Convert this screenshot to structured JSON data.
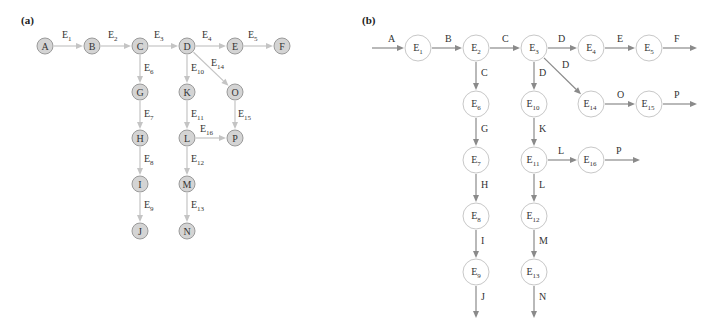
{
  "panels": [
    {
      "label": "(a)",
      "label_pos": {
        "x": 21,
        "y": 10
      },
      "style": {
        "node_fill": "#d4d4d4",
        "node_stroke": "#9a9a9a",
        "edge_color": "#c4c4c4",
        "node_r": 8,
        "font_size": 10
      },
      "nodes": [
        {
          "id": "A",
          "x": 45,
          "y": 46
        },
        {
          "id": "B",
          "x": 92,
          "y": 46
        },
        {
          "id": "C",
          "x": 140,
          "y": 46
        },
        {
          "id": "D",
          "x": 187,
          "y": 46
        },
        {
          "id": "E",
          "x": 235,
          "y": 46
        },
        {
          "id": "F",
          "x": 282,
          "y": 46
        },
        {
          "id": "G",
          "x": 140,
          "y": 92
        },
        {
          "id": "H",
          "x": 140,
          "y": 138
        },
        {
          "id": "I",
          "x": 140,
          "y": 184
        },
        {
          "id": "J",
          "x": 140,
          "y": 231
        },
        {
          "id": "K",
          "x": 187,
          "y": 92
        },
        {
          "id": "L",
          "x": 187,
          "y": 138
        },
        {
          "id": "M",
          "x": 187,
          "y": 184
        },
        {
          "id": "N",
          "x": 187,
          "y": 231
        },
        {
          "id": "O",
          "x": 235,
          "y": 92
        },
        {
          "id": "P",
          "x": 235,
          "y": 138
        }
      ],
      "edges": [
        {
          "from": "A",
          "to": "B",
          "label": "E",
          "sub": "1",
          "lx": 62,
          "ly": 38
        },
        {
          "from": "B",
          "to": "C",
          "label": "E",
          "sub": "2",
          "lx": 108,
          "ly": 38
        },
        {
          "from": "C",
          "to": "D",
          "label": "E",
          "sub": "3",
          "lx": 154,
          "ly": 38
        },
        {
          "from": "D",
          "to": "E",
          "label": "E",
          "sub": "4",
          "lx": 202,
          "ly": 38
        },
        {
          "from": "E",
          "to": "F",
          "label": "E",
          "sub": "5",
          "lx": 248,
          "ly": 38
        },
        {
          "from": "C",
          "to": "G",
          "label": "E",
          "sub": "6",
          "lx": 144,
          "ly": 71
        },
        {
          "from": "G",
          "to": "H",
          "label": "E",
          "sub": "7",
          "lx": 144,
          "ly": 117
        },
        {
          "from": "H",
          "to": "I",
          "label": "E",
          "sub": "8",
          "lx": 144,
          "ly": 162
        },
        {
          "from": "I",
          "to": "J",
          "label": "E",
          "sub": "9",
          "lx": 144,
          "ly": 208
        },
        {
          "from": "D",
          "to": "K",
          "label": "E",
          "sub": "10",
          "lx": 191,
          "ly": 71
        },
        {
          "from": "K",
          "to": "L",
          "label": "E",
          "sub": "11",
          "lx": 191,
          "ly": 117
        },
        {
          "from": "L",
          "to": "M",
          "label": "E",
          "sub": "12",
          "lx": 191,
          "ly": 162
        },
        {
          "from": "M",
          "to": "N",
          "label": "E",
          "sub": "13",
          "lx": 191,
          "ly": 208
        },
        {
          "from": "D",
          "to": "O",
          "label": "E",
          "sub": "14",
          "lx": 211,
          "ly": 66
        },
        {
          "from": "O",
          "to": "P",
          "label": "E",
          "sub": "15",
          "lx": 238,
          "ly": 117
        },
        {
          "from": "L",
          "to": "P",
          "label": "E",
          "sub": "16",
          "lx": 200,
          "ly": 132
        }
      ],
      "open_edges": []
    },
    {
      "label": "(b)",
      "label_pos": {
        "x": 362,
        "y": 10
      },
      "style": {
        "node_fill": "#ffffff",
        "node_stroke": "#c8c8c8",
        "edge_color": "#8a8a8a",
        "node_r": 13,
        "font_size": 10
      },
      "nodes": [
        {
          "id": "E1",
          "label": "E",
          "sub": "1",
          "x": 418,
          "y": 48
        },
        {
          "id": "E2",
          "label": "E",
          "sub": "2",
          "x": 476,
          "y": 48
        },
        {
          "id": "E3",
          "label": "E",
          "sub": "3",
          "x": 534,
          "y": 48
        },
        {
          "id": "E4",
          "label": "E",
          "sub": "4",
          "x": 591,
          "y": 48
        },
        {
          "id": "E5",
          "label": "E",
          "sub": "5",
          "x": 649,
          "y": 48
        },
        {
          "id": "E6",
          "label": "E",
          "sub": "6",
          "x": 476,
          "y": 104
        },
        {
          "id": "E7",
          "label": "E",
          "sub": "7",
          "x": 476,
          "y": 160
        },
        {
          "id": "E8",
          "label": "E",
          "sub": "8",
          "x": 476,
          "y": 216
        },
        {
          "id": "E9",
          "label": "E",
          "sub": "9",
          "x": 476,
          "y": 272
        },
        {
          "id": "E10",
          "label": "E",
          "sub": "10",
          "x": 534,
          "y": 104
        },
        {
          "id": "E11",
          "label": "E",
          "sub": "11",
          "x": 534,
          "y": 160
        },
        {
          "id": "E12",
          "label": "E",
          "sub": "12",
          "x": 534,
          "y": 216
        },
        {
          "id": "E13",
          "label": "E",
          "sub": "13",
          "x": 534,
          "y": 272
        },
        {
          "id": "E14",
          "label": "E",
          "sub": "14",
          "x": 591,
          "y": 104
        },
        {
          "id": "E15",
          "label": "E",
          "sub": "15",
          "x": 649,
          "y": 104
        },
        {
          "id": "E16",
          "label": "E",
          "sub": "16",
          "x": 591,
          "y": 160
        }
      ],
      "edges": [
        {
          "from": "E1",
          "to": "E2",
          "label": "B",
          "lx": 445,
          "ly": 42
        },
        {
          "from": "E2",
          "to": "E3",
          "label": "C",
          "lx": 502,
          "ly": 42
        },
        {
          "from": "E3",
          "to": "E4",
          "label": "D",
          "lx": 558,
          "ly": 42
        },
        {
          "from": "E4",
          "to": "E5",
          "label": "E",
          "lx": 617,
          "ly": 42
        },
        {
          "from": "E2",
          "to": "E6",
          "label": "C",
          "lx": 481,
          "ly": 76
        },
        {
          "from": "E6",
          "to": "E7",
          "label": "G",
          "lx": 481,
          "ly": 132
        },
        {
          "from": "E7",
          "to": "E8",
          "label": "H",
          "lx": 481,
          "ly": 188
        },
        {
          "from": "E8",
          "to": "E9",
          "label": "I",
          "lx": 481,
          "ly": 244
        },
        {
          "from": "E3",
          "to": "E10",
          "label": "D",
          "lx": 539,
          "ly": 76
        },
        {
          "from": "E10",
          "to": "E11",
          "label": "K",
          "lx": 539,
          "ly": 132
        },
        {
          "from": "E11",
          "to": "E12",
          "label": "L",
          "lx": 539,
          "ly": 188
        },
        {
          "from": "E12",
          "to": "E13",
          "label": "M",
          "lx": 539,
          "ly": 244
        },
        {
          "from": "E3",
          "to": "E14",
          "label": "D",
          "lx": 562,
          "ly": 68
        },
        {
          "from": "E14",
          "to": "E15",
          "label": "O",
          "lx": 617,
          "ly": 98
        },
        {
          "from": "E11",
          "to": "E16",
          "label": "L",
          "lx": 558,
          "ly": 154
        }
      ],
      "open_edges": [
        {
          "x1": 372,
          "y1": 48,
          "to": "E1",
          "label": "A",
          "lx": 388,
          "ly": 42
        },
        {
          "from": "E5",
          "x2": 697,
          "y2": 48,
          "label": "F",
          "lx": 674,
          "ly": 42
        },
        {
          "from": "E15",
          "x2": 697,
          "y2": 104,
          "label": "P",
          "lx": 674,
          "ly": 98
        },
        {
          "from": "E16",
          "x2": 640,
          "y2": 160,
          "label": "P",
          "lx": 616,
          "ly": 154
        },
        {
          "from": "E9",
          "x2": 476,
          "y2": 318,
          "label": "J",
          "lx": 481,
          "ly": 300
        },
        {
          "from": "E13",
          "x2": 534,
          "y2": 318,
          "label": "N",
          "lx": 539,
          "ly": 300
        }
      ]
    }
  ]
}
